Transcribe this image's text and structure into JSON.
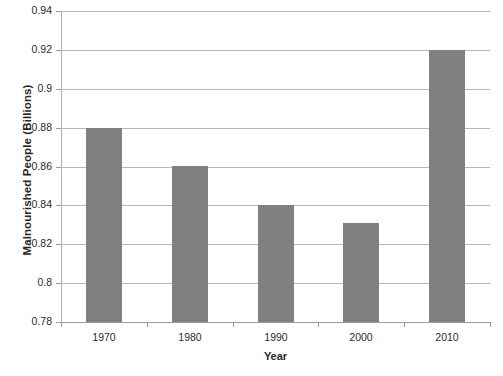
{
  "chart_data": {
    "type": "bar",
    "title": "",
    "xlabel": "Year",
    "ylabel": "Malnourished People (Billions)",
    "categories": [
      "1970",
      "1980",
      "1990",
      "2000",
      "2010"
    ],
    "values": [
      0.88,
      0.86,
      0.84,
      0.831,
      0.92
    ],
    "ylim": [
      0.78,
      0.94
    ],
    "ytick_step": 0.02,
    "yticks": [
      "0.94",
      "0.92",
      "0.9",
      "0.88",
      "0.86",
      "0.84",
      "0.82",
      "0.8",
      "0.78"
    ],
    "ytick_values": [
      0.94,
      0.92,
      0.9,
      0.88,
      0.86,
      0.84,
      0.82,
      0.8,
      0.78
    ],
    "grid": "horizontal",
    "legend": "none",
    "bar_color": "#808080",
    "gridline_color": "#b7b7b7",
    "axis_color": "#9a9a9a",
    "background": "#ffffff",
    "series": [
      {
        "name": "Malnourished People (Billions)",
        "values": [
          0.88,
          0.86,
          0.84,
          0.831,
          0.92
        ]
      }
    ]
  },
  "footer": {
    "clipped_caption": ""
  }
}
